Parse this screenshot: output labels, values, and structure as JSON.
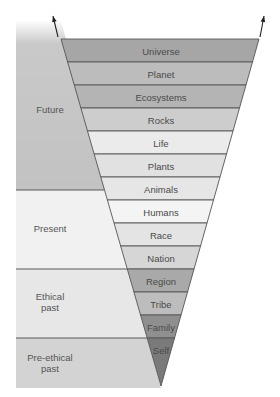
{
  "diagram": {
    "type": "inverted-triangle-expanding-circle",
    "eras": [
      {
        "id": "future",
        "label_lines": [
          "Future"
        ],
        "y0": 20,
        "y1": 190,
        "color": "#c4c4c4",
        "label_y": 113
      },
      {
        "id": "present",
        "label_lines": [
          "Present"
        ],
        "y0": 190,
        "y1": 269,
        "color": "#f1f1f1",
        "label_y": 232
      },
      {
        "id": "ethical-past",
        "label_lines": [
          "Ethical",
          "past"
        ],
        "y0": 269,
        "y1": 338,
        "color": "#e7e7e7",
        "label_y": 300
      },
      {
        "id": "pre-ethical-past",
        "label_lines": [
          "Pre-ethical",
          "past"
        ],
        "y0": 338,
        "y1": 388,
        "color": "#d3d3d3",
        "label_y": 361
      }
    ],
    "bands": [
      {
        "label": "Universe",
        "color": "#a6a6a6"
      },
      {
        "label": "Planet",
        "color": "#bcbcbc"
      },
      {
        "label": "Ecosystems",
        "color": "#b4b4b4"
      },
      {
        "label": "Rocks",
        "color": "#cdcdcd"
      },
      {
        "label": "Life",
        "color": "#ebebeb"
      },
      {
        "label": "Plants",
        "color": "#e1e1e1"
      },
      {
        "label": "Animals",
        "color": "#e6e6e6"
      },
      {
        "label": "Humans",
        "color": "#f4f4f4"
      },
      {
        "label": "Race",
        "color": "#e4e4e4"
      },
      {
        "label": "Nation",
        "color": "#d6d6d6"
      },
      {
        "label": "Region",
        "color": "#a9a9a9"
      },
      {
        "label": "Tribe",
        "color": "#bdbdbd"
      },
      {
        "label": "Family",
        "color": "#8f8f8f"
      },
      {
        "label": "Self",
        "color": "#7a7a7a"
      }
    ],
    "geometry": {
      "top_y": 39,
      "band_height": 23,
      "top_left_x": 61,
      "top_right_x": 259,
      "apex_x": 161,
      "apex_y": 386,
      "panel_left_x": 16
    },
    "arrows": [
      {
        "id": "left-arrow",
        "from": [
          58,
          37
        ],
        "to": [
          53,
          16
        ]
      },
      {
        "id": "right-arrow",
        "from": [
          260,
          37
        ],
        "to": [
          264,
          16
        ]
      }
    ]
  }
}
